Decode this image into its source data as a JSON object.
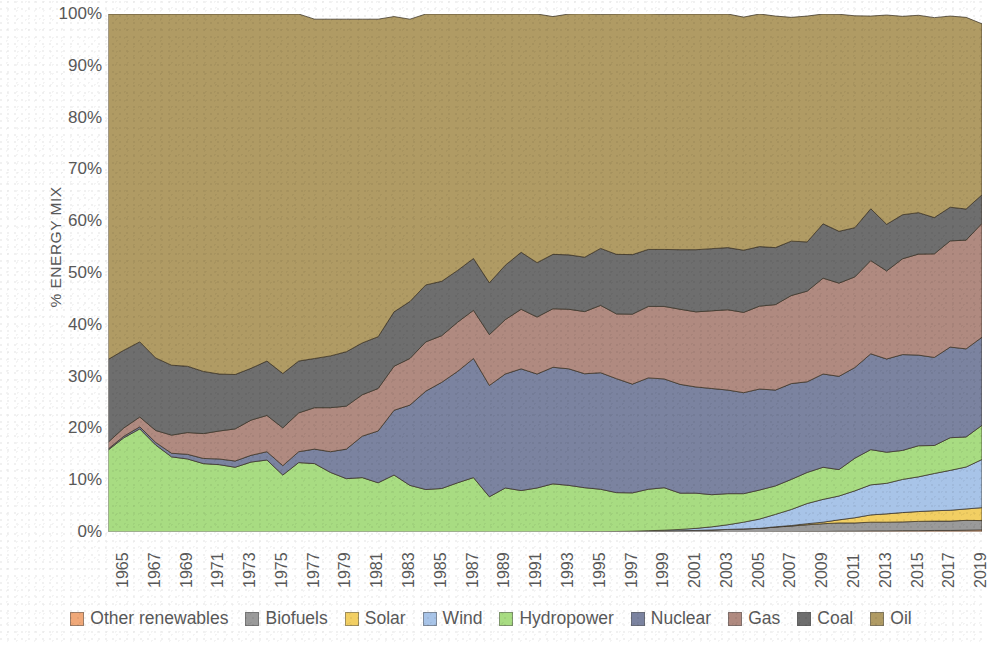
{
  "chart_data": {
    "type": "area",
    "stacked": true,
    "title": "",
    "xlabel": "",
    "ylabel": "% ENERGY MIX",
    "ylim": [
      0,
      100
    ],
    "ytick_labels": [
      "0%",
      "10%",
      "20%",
      "30%",
      "40%",
      "50%",
      "60%",
      "70%",
      "80%",
      "90%",
      "100%"
    ],
    "ytick_values": [
      0,
      10,
      20,
      30,
      40,
      50,
      60,
      70,
      80,
      90,
      100
    ],
    "grid": false,
    "legend_position": "bottom",
    "x": [
      1965,
      1966,
      1967,
      1968,
      1969,
      1970,
      1971,
      1972,
      1973,
      1974,
      1975,
      1976,
      1977,
      1978,
      1979,
      1980,
      1981,
      1982,
      1983,
      1984,
      1985,
      1986,
      1987,
      1988,
      1989,
      1990,
      1991,
      1992,
      1993,
      1994,
      1995,
      1996,
      1997,
      1998,
      1999,
      2000,
      2001,
      2002,
      2003,
      2004,
      2005,
      2006,
      2007,
      2008,
      2009,
      2010,
      2011,
      2012,
      2013,
      2014,
      2015,
      2016,
      2017,
      2018,
      2019,
      2020
    ],
    "xtick_labels": [
      "1965",
      "1967",
      "1969",
      "1971",
      "1973",
      "1975",
      "1977",
      "1979",
      "1981",
      "1983",
      "1985",
      "1987",
      "1989",
      "1991",
      "1993",
      "1995",
      "1997",
      "1999",
      "2001",
      "2003",
      "2005",
      "2007",
      "2009",
      "2011",
      "2013",
      "2015",
      "2017",
      "2019"
    ],
    "series": [
      {
        "name": "Other renewables",
        "color": "#f0a878",
        "values": [
          0,
          0,
          0,
          0,
          0,
          0,
          0,
          0,
          0,
          0,
          0,
          0,
          0,
          0,
          0,
          0,
          0,
          0,
          0,
          0,
          0,
          0,
          0,
          0,
          0,
          0,
          0,
          0,
          0,
          0,
          0,
          0,
          0,
          0,
          0,
          0,
          0,
          0,
          0,
          0,
          0,
          0,
          0.05,
          0.05,
          0.1,
          0.1,
          0.15,
          0.15,
          0.2,
          0.2,
          0.25,
          0.25,
          0.3,
          0.3,
          0.35,
          0.4
        ]
      },
      {
        "name": "Biofuels",
        "color": "#9a9a9a",
        "values": [
          0,
          0,
          0,
          0,
          0,
          0,
          0,
          0,
          0,
          0,
          0,
          0,
          0,
          0,
          0,
          0,
          0,
          0,
          0,
          0,
          0,
          0,
          0,
          0,
          0,
          0,
          0,
          0,
          0,
          0,
          0.05,
          0.05,
          0.1,
          0.1,
          0.15,
          0.2,
          0.25,
          0.3,
          0.4,
          0.5,
          0.6,
          0.7,
          0.9,
          1.1,
          1.3,
          1.5,
          1.6,
          1.6,
          1.7,
          1.7,
          1.7,
          1.8,
          1.8,
          1.8,
          1.9,
          1.8
        ]
      },
      {
        "name": "Solar",
        "color": "#f2cf63",
        "values": [
          0,
          0,
          0,
          0,
          0,
          0,
          0,
          0,
          0,
          0,
          0,
          0,
          0,
          0,
          0,
          0,
          0,
          0,
          0,
          0,
          0,
          0,
          0,
          0,
          0,
          0,
          0,
          0,
          0,
          0,
          0,
          0,
          0,
          0,
          0,
          0,
          0,
          0,
          0,
          0,
          0,
          0,
          0.05,
          0.1,
          0.2,
          0.3,
          0.6,
          1.0,
          1.4,
          1.6,
          1.8,
          1.9,
          2.0,
          2.1,
          2.2,
          2.5
        ]
      },
      {
        "name": "Wind",
        "color": "#a8c4e8",
        "values": [
          0,
          0,
          0,
          0,
          0,
          0,
          0,
          0,
          0,
          0,
          0,
          0,
          0,
          0,
          0,
          0,
          0,
          0,
          0,
          0,
          0,
          0,
          0,
          0,
          0,
          0,
          0,
          0,
          0,
          0,
          0,
          0,
          0,
          0.05,
          0.1,
          0.15,
          0.25,
          0.4,
          0.6,
          0.9,
          1.3,
          1.8,
          2.4,
          3.1,
          3.9,
          4.4,
          4.6,
          5.2,
          5.8,
          5.9,
          6.4,
          6.7,
          7.2,
          7.7,
          8.1,
          9.3
        ]
      },
      {
        "name": "Hydropower",
        "color": "#a8dc82",
        "values": [
          15.8,
          18.2,
          19.9,
          16.8,
          14.5,
          14.1,
          13.2,
          13.0,
          12.5,
          13.5,
          13.9,
          11.0,
          13.4,
          13.2,
          11.5,
          10.3,
          10.5,
          9.5,
          11.0,
          9.0,
          8.2,
          8.4,
          9.5,
          10.5,
          6.8,
          8.5,
          8.0,
          8.5,
          9.3,
          9.0,
          8.5,
          8.2,
          7.5,
          7.4,
          8.0,
          8.2,
          7.0,
          6.8,
          6.2,
          6.0,
          5.5,
          5.6,
          5.5,
          5.8,
          6.0,
          6.2,
          5.1,
          6.3,
          6.8,
          6.0,
          5.6,
          6.0,
          5.4,
          6.3,
          5.8,
          6.6
        ]
      },
      {
        "name": "Nuclear",
        "color": "#7b83a0",
        "values": [
          0.2,
          0.3,
          0.4,
          0.5,
          0.7,
          0.9,
          1.0,
          1.1,
          1.2,
          1.3,
          1.6,
          1.8,
          2.1,
          2.8,
          4.0,
          5.7,
          8.0,
          10.0,
          12.5,
          15.5,
          19.0,
          20.5,
          21.5,
          23.0,
          21.5,
          22.0,
          23.5,
          22.0,
          22.5,
          22.5,
          22.0,
          22.5,
          22.0,
          21.0,
          21.5,
          21.0,
          21.0,
          20.5,
          20.5,
          20.0,
          19.5,
          19.5,
          18.5,
          18.5,
          17.5,
          18.0,
          18.0,
          17.5,
          18.5,
          18.0,
          18.5,
          17.5,
          17.0,
          17.5,
          17.0,
          17.0
        ]
      },
      {
        "name": "Gas",
        "color": "#b08a80",
        "values": [
          1.3,
          1.6,
          1.9,
          2.3,
          3.5,
          4.2,
          4.8,
          5.4,
          6.2,
          6.8,
          7.0,
          7.3,
          7.5,
          8.0,
          8.5,
          8.3,
          8.0,
          8.2,
          8.5,
          9.0,
          9.5,
          9.0,
          9.5,
          9.3,
          9.8,
          10.5,
          11.5,
          11.0,
          11.3,
          11.5,
          12.0,
          13.0,
          12.5,
          13.5,
          13.8,
          14.0,
          14.5,
          14.5,
          15.0,
          15.5,
          15.5,
          16.0,
          16.5,
          17.0,
          17.5,
          18.5,
          18.0,
          17.5,
          18.0,
          17.0,
          18.5,
          19.5,
          20.0,
          20.5,
          21.0,
          22.0
        ]
      },
      {
        "name": "Coal",
        "color": "#6e6e6e",
        "values": [
          16.0,
          15.0,
          14.5,
          14.0,
          13.5,
          12.8,
          12.0,
          11.0,
          10.5,
          10.0,
          10.5,
          10.5,
          10.0,
          9.5,
          10.0,
          10.5,
          10.0,
          10.0,
          10.5,
          11.0,
          11.0,
          10.5,
          10.0,
          10.0,
          10.0,
          10.5,
          11.0,
          10.5,
          10.5,
          10.5,
          10.5,
          11.0,
          11.5,
          11.5,
          11.0,
          11.0,
          11.5,
          12.0,
          12.0,
          12.0,
          12.0,
          11.5,
          11.0,
          10.5,
          9.5,
          10.5,
          10.0,
          9.5,
          10.0,
          9.0,
          8.5,
          8.0,
          7.0,
          6.5,
          6.0,
          5.5
        ]
      },
      {
        "name": "Oil",
        "color": "#b09b64",
        "values": [
          66.7,
          64.9,
          63.3,
          66.4,
          67.8,
          68.0,
          69.0,
          69.5,
          69.6,
          68.4,
          67.0,
          69.4,
          67.0,
          65.5,
          65.0,
          64.2,
          62.5,
          61.3,
          57.0,
          54.5,
          52.3,
          51.6,
          49.5,
          47.2,
          51.9,
          48.5,
          46.0,
          48.0,
          45.9,
          46.5,
          47.0,
          45.2,
          46.4,
          46.5,
          45.5,
          45.4,
          45.5,
          45.5,
          45.3,
          45.1,
          45.0,
          44.9,
          44.7,
          43.2,
          43.6,
          40.5,
          41.9,
          40.9,
          37.2,
          40.4,
          38.3,
          38.1,
          38.6,
          36.9,
          37.0,
          33.0
        ]
      }
    ]
  },
  "legend": {
    "items": [
      {
        "label": "Other renewables",
        "color": "#f0a878"
      },
      {
        "label": "Biofuels",
        "color": "#9a9a9a"
      },
      {
        "label": "Solar",
        "color": "#f2cf63"
      },
      {
        "label": "Wind",
        "color": "#a8c4e8"
      },
      {
        "label": "Hydropower",
        "color": "#a8dc82"
      },
      {
        "label": "Nuclear",
        "color": "#7b83a0"
      },
      {
        "label": "Gas",
        "color": "#b08a80"
      },
      {
        "label": "Coal",
        "color": "#6e6e6e"
      },
      {
        "label": "Oil",
        "color": "#b09b64"
      }
    ]
  }
}
